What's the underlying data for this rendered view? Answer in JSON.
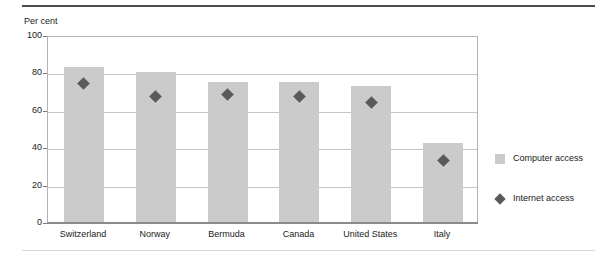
{
  "chart_data": {
    "type": "bar",
    "title": "",
    "subtitle": "",
    "xlabel": "",
    "ylabel": "Per cent",
    "ylim": [
      0,
      100
    ],
    "yticks": [
      0,
      20,
      40,
      60,
      80,
      100
    ],
    "ytick_labels": [
      "0",
      "20",
      "40",
      "60",
      "80",
      "100"
    ],
    "grid": true,
    "legend_position": "right",
    "categories": [
      "Switzerland",
      "Norway",
      "Bermuda",
      "Canada",
      "United States",
      "Italy"
    ],
    "series": [
      {
        "name": "Computer access",
        "type": "bar",
        "color": "#cbcbcb",
        "values": [
          83,
          80,
          75,
          75,
          73,
          42
        ]
      },
      {
        "name": "Internet access",
        "type": "scatter",
        "marker": "diamond",
        "color": "#5a5a5a",
        "values": [
          75,
          68,
          69,
          68,
          65,
          34
        ]
      }
    ]
  },
  "legend": {
    "items": [
      {
        "label": "Computer access",
        "swatch": "square-icon"
      },
      {
        "label": "Internet access",
        "swatch": "diamond-icon"
      }
    ]
  }
}
